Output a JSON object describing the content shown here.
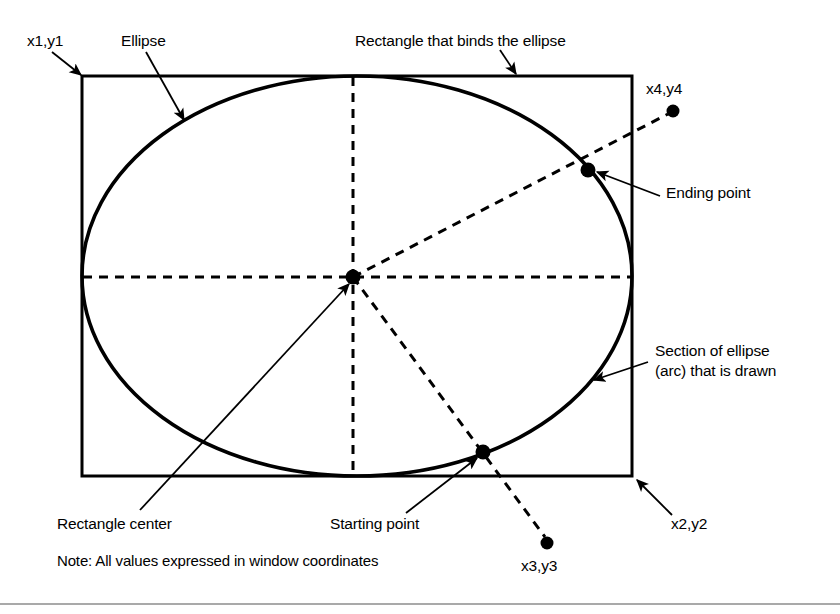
{
  "figure": {
    "type": "technical-diagram",
    "background_color": "#ffffff",
    "stroke_color": "#000000",
    "width": 840,
    "height": 614
  },
  "labels": {
    "x1y1": "x1,y1",
    "x2y2": "x2,y2",
    "x3y3": "x3,y3",
    "x4y4": "x4,y4",
    "ellipse": "Ellipse",
    "bounding_rectangle": "Rectangle that binds the ellipse",
    "ending_point": "Ending point",
    "starting_point": "Starting point",
    "rectangle_center": "Rectangle center",
    "arc_section_line1": "Section of ellipse",
    "arc_section_line2": "(arc) that is drawn",
    "note": "Note: All values expressed in window coordinates"
  },
  "geometry": {
    "rectangle": {
      "x1": 82,
      "y1": 76,
      "x2": 632,
      "y2": 476
    },
    "ellipse": {
      "cx": 357,
      "cy": 276,
      "rx": 275,
      "ry": 200
    },
    "center_dot": {
      "x": 353,
      "y": 277,
      "r": 7
    },
    "starting_point_dot": {
      "x": 483,
      "y": 452,
      "r": 7
    },
    "ending_point_dot": {
      "x": 588,
      "y": 170,
      "r": 7
    },
    "x3y3_dot": {
      "x": 547,
      "y": 543,
      "r": 6
    },
    "x4y4_dot": {
      "x": 673,
      "y": 111,
      "r": 6
    },
    "bottom_rule_y": 604
  },
  "style_values": {
    "rect_stroke_width": 3,
    "ellipse_stroke_width": 3.5,
    "dashed_stroke_width": 3,
    "dash_pattern": "9 7",
    "leader_stroke_width": 1.6,
    "rule_stroke_width": 1.2
  }
}
